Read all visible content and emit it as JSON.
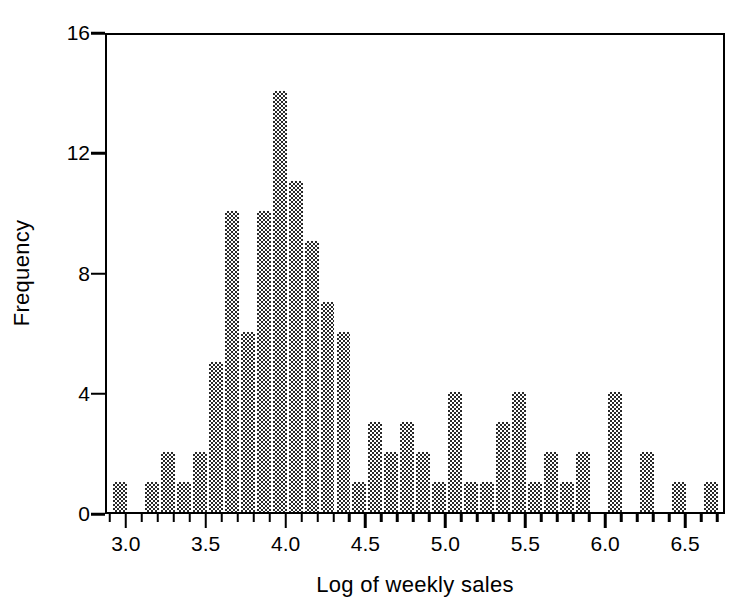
{
  "chart_data": {
    "type": "bar",
    "chart_subtype": "histogram",
    "title": "",
    "xlabel": "Log of weekly sales",
    "ylabel": "Frequency",
    "xlim": [
      2.87,
      6.75
    ],
    "ylim": [
      0,
      16
    ],
    "bin_width": 0.1,
    "grid": false,
    "legend": false,
    "x_major_ticks": [
      3.0,
      3.5,
      4.0,
      4.5,
      5.0,
      5.5,
      6.0,
      6.5
    ],
    "x_major_tick_labels": [
      "3.0",
      "3.5",
      "4.0",
      "4.5",
      "5.0",
      "5.5",
      "6.0",
      "6.5"
    ],
    "x_minor_tick_step": 0.1,
    "y_major_ticks": [
      0,
      4,
      8,
      12,
      16
    ],
    "y_major_tick_labels": [
      "0",
      "4",
      "8",
      "12",
      "16"
    ],
    "bar_fill": "#2a2a2a",
    "bar_pattern": "checkerboard-dither",
    "axis_color": "#000000",
    "background": "#ffffff",
    "bin_starts": [
      2.9,
      3.0,
      3.1,
      3.2,
      3.3,
      3.4,
      3.5,
      3.6,
      3.7,
      3.8,
      3.9,
      4.0,
      4.1,
      4.2,
      4.3,
      4.4,
      4.5,
      4.6,
      4.7,
      4.8,
      4.9,
      5.0,
      5.1,
      5.2,
      5.3,
      5.4,
      5.5,
      5.6,
      5.7,
      5.8,
      5.9,
      6.0,
      6.1,
      6.2,
      6.3,
      6.4,
      6.5,
      6.6
    ],
    "values": [
      1,
      0,
      1,
      2,
      1,
      2,
      5,
      10,
      6,
      10,
      14,
      11,
      9,
      7,
      6,
      1,
      3,
      2,
      3,
      2,
      1,
      4,
      1,
      1,
      3,
      4,
      1,
      2,
      1,
      2,
      0,
      4,
      0,
      2,
      0,
      1,
      0,
      1
    ],
    "categories": [
      "2.90",
      "3.00",
      "3.10",
      "3.20",
      "3.30",
      "3.40",
      "3.50",
      "3.60",
      "3.70",
      "3.80",
      "3.90",
      "4.00",
      "4.10",
      "4.20",
      "4.30",
      "4.40",
      "4.50",
      "4.60",
      "4.70",
      "4.80",
      "4.90",
      "5.00",
      "5.10",
      "5.20",
      "5.30",
      "5.40",
      "5.50",
      "5.60",
      "5.70",
      "5.80",
      "5.90",
      "6.00",
      "6.10",
      "6.20",
      "6.30",
      "6.40",
      "6.50",
      "6.60"
    ],
    "max_value": 14,
    "total_count": 134
  }
}
